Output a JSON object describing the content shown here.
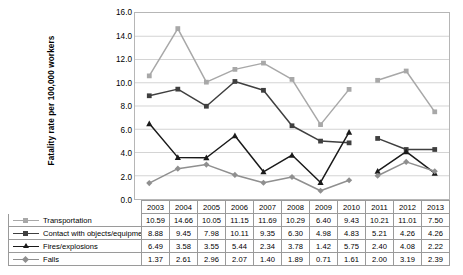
{
  "chart_data": {
    "type": "line",
    "title": "",
    "xlabel": "",
    "ylabel": "Fatality rate per 100,000 workers",
    "ylim": [
      0.0,
      16.0
    ],
    "ytick_step": 2.0,
    "yticks": [
      "16.0",
      "14.0",
      "12.0",
      "10.0",
      "8.0",
      "6.0",
      "4.0",
      "2.0",
      "0.0"
    ],
    "grid": "horizontal",
    "legend_position": "bottom-table",
    "categories": [
      "2003",
      "2004",
      "2005",
      "2006",
      "2007",
      "2008",
      "2009",
      "2010",
      "2011",
      "2012",
      "2013"
    ],
    "series": [
      {
        "name": "Transportation",
        "color": "#a8a8a8",
        "marker": "square",
        "values": [
          10.59,
          14.66,
          10.05,
          11.15,
          11.69,
          10.29,
          6.4,
          9.43,
          10.21,
          11.01,
          7.5
        ],
        "value_labels": [
          "10.59",
          "14.66",
          "10.05",
          "11.15",
          "11.69",
          "10.29",
          "6.40",
          "9.43",
          "10.21",
          "11.01",
          "7.50"
        ]
      },
      {
        "name": "Contact with objects/equipment",
        "color": "#3f3f3f",
        "marker": "square",
        "values": [
          8.88,
          9.45,
          7.98,
          10.11,
          9.35,
          6.3,
          4.98,
          4.83,
          5.21,
          4.26,
          4.26
        ],
        "value_labels": [
          "8.88",
          "9.45",
          "7.98",
          "10.11",
          "9.35",
          "6.30",
          "4.98",
          "4.83",
          "5.21",
          "4.26",
          "4.26"
        ]
      },
      {
        "name": "Fires/explosions",
        "color": "#1a1a1a",
        "marker": "triangle",
        "values": [
          6.49,
          3.58,
          3.55,
          5.44,
          2.34,
          3.78,
          1.42,
          5.75,
          2.4,
          4.08,
          2.22
        ],
        "value_labels": [
          "6.49",
          "3.58",
          "3.55",
          "5.44",
          "2.34",
          "3.78",
          "1.42",
          "5.75",
          "2.40",
          "4.08",
          "2.22"
        ]
      },
      {
        "name": "Falls",
        "color": "#8f8f8f",
        "marker": "diamond",
        "values": [
          1.37,
          2.61,
          2.96,
          2.07,
          1.4,
          1.89,
          0.71,
          1.61,
          2.0,
          3.19,
          2.39
        ],
        "value_labels": [
          "1.37",
          "2.61",
          "2.96",
          "2.07",
          "1.40",
          "1.89",
          "0.71",
          "1.61",
          "2.00",
          "3.19",
          "2.39"
        ]
      }
    ],
    "line_break_between": [
      "2010",
      "2011"
    ]
  },
  "table": {
    "corner_label": "",
    "year_headers": [
      "2003",
      "2004",
      "2005",
      "2006",
      "2007",
      "2008",
      "2009",
      "2010",
      "2011",
      "2012",
      "2013"
    ],
    "rows": [
      {
        "label": "Transportation",
        "cells": [
          "10.59",
          "14.66",
          "10.05",
          "11.15",
          "11.69",
          "10.29",
          "6.40",
          "9.43",
          "10.21",
          "11.01",
          "7.50"
        ]
      },
      {
        "label": "Contact with objects/equipment",
        "cells": [
          "8.88",
          "9.45",
          "7.98",
          "10.11",
          "9.35",
          "6.30",
          "4.98",
          "4.83",
          "5.21",
          "4.26",
          "4.26"
        ]
      },
      {
        "label": "Fires/explosions",
        "cells": [
          "6.49",
          "3.58",
          "3.55",
          "5.44",
          "2.34",
          "3.78",
          "1.42",
          "5.75",
          "2.40",
          "4.08",
          "2.22"
        ]
      },
      {
        "label": "Falls",
        "cells": [
          "1.37",
          "2.61",
          "2.96",
          "2.07",
          "1.40",
          "1.89",
          "0.71",
          "1.61",
          "2.00",
          "3.19",
          "2.39"
        ]
      }
    ]
  },
  "colors": {
    "grid": "#c9c9c9",
    "plot_border": "#b6b6b6",
    "table_border": "#9a9a9a",
    "background": "#ffffff",
    "text": "#000000"
  }
}
